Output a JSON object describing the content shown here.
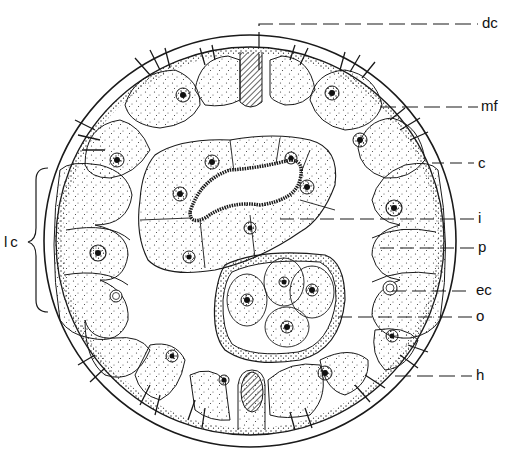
{
  "figure": {
    "ink_color": "#1a1a1a",
    "background": "#ffffff"
  },
  "labels": [
    {
      "id": "dc",
      "text": "dc",
      "x": 482,
      "y": 17
    },
    {
      "id": "mf",
      "text": "mf",
      "x": 482,
      "y": 100
    },
    {
      "id": "c",
      "text": "c",
      "x": 478,
      "y": 157
    },
    {
      "id": "i",
      "text": "i",
      "x": 478,
      "y": 212
    },
    {
      "id": "p",
      "text": "p",
      "x": 478,
      "y": 241
    },
    {
      "id": "ec",
      "text": "ec",
      "x": 476,
      "y": 284
    },
    {
      "id": "o",
      "text": "o",
      "x": 476,
      "y": 310
    },
    {
      "id": "h",
      "text": "h",
      "x": 476,
      "y": 369
    }
  ],
  "left_label": {
    "text": "lc",
    "x": 6,
    "y": 236
  }
}
